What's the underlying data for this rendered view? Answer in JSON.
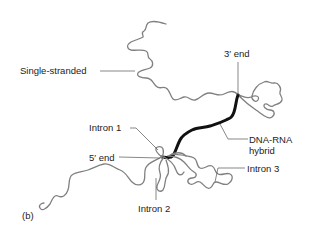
{
  "figure": {
    "panel_label": "(b)",
    "colors": {
      "single_strand": "#808080",
      "dna_rna_hybrid": "#111111",
      "leader_lines": "#555555",
      "text": "#222222"
    },
    "labels": {
      "single_stranded": "Single-stranded",
      "three_prime_end": "3′ end",
      "intron1": "Intron 1",
      "five_prime_end": "5′ end",
      "dna_rna_hybrid_line1": "DNA-RNA",
      "dna_rna_hybrid_line2": "hybrid",
      "intron3": "Intron 3",
      "intron2": "Intron 2"
    }
  }
}
